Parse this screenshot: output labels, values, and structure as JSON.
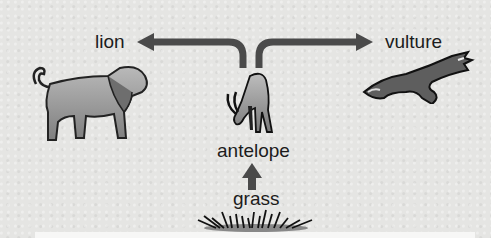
{
  "diagram": {
    "type": "food-chain",
    "nodes": [
      {
        "id": "grass",
        "label": "grass"
      },
      {
        "id": "antelope",
        "label": "antelope"
      },
      {
        "id": "lion",
        "label": "lion"
      },
      {
        "id": "vulture",
        "label": "vulture"
      }
    ],
    "edges": [
      {
        "from": "grass",
        "to": "antelope"
      },
      {
        "from": "antelope",
        "to": "lion"
      },
      {
        "from": "antelope",
        "to": "vulture"
      }
    ],
    "colors": {
      "background": "#e5e5e3",
      "arrow": "#4a4a4a",
      "text": "#1c1c1c",
      "animal_fill": "#9a9a9a"
    }
  }
}
